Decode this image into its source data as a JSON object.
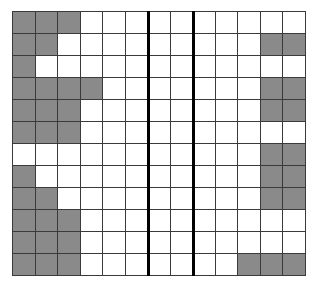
{
  "grid": {
    "columns": 13,
    "rows": 12,
    "colors": {
      "shaded": "#8a8a8a",
      "empty": "#ffffff",
      "line": "#3a3a3a",
      "divider": "#000000"
    },
    "dividers_after_columns": [
      6,
      8
    ],
    "shaded_cells": [
      [
        0,
        1,
        2
      ],
      [
        0,
        1,
        11,
        12
      ],
      [
        0
      ],
      [
        0,
        1,
        2,
        3,
        11,
        12
      ],
      [
        0,
        1,
        2,
        11,
        12
      ],
      [
        0,
        1,
        2
      ],
      [
        11,
        12
      ],
      [
        0,
        11,
        12
      ],
      [
        0,
        1,
        11,
        12
      ],
      [
        0,
        1,
        2
      ],
      [
        0,
        1,
        2
      ],
      [
        0,
        1,
        2,
        10,
        11,
        12
      ]
    ]
  }
}
